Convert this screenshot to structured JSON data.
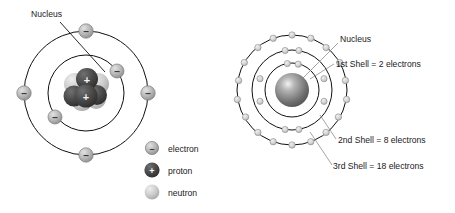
{
  "figure": {
    "background_color": "#ffffff"
  },
  "left_diagram": {
    "name": "bohr-atom-with-nucleus-detail",
    "nucleus_label": "Nucleus",
    "center": {
      "x": 86,
      "y": 93
    },
    "shells": [
      {
        "index": 1,
        "radius": 38,
        "electron_count": 2,
        "electron_angles_deg": [
          -35,
          145
        ]
      },
      {
        "index": 2,
        "radius": 62,
        "electron_count": 4,
        "electron_angles_deg": [
          -90,
          0,
          90,
          180
        ]
      }
    ],
    "nucleus": {
      "protons": 2,
      "neutrons": 4,
      "proton_symbol": "+",
      "proton_color": "#4a4a4a",
      "neutron_color": "#c9c9c9"
    },
    "legend": {
      "items": [
        {
          "icon": "electron-icon",
          "symbol": "–",
          "label": "electron",
          "color": "#b3b3b3"
        },
        {
          "icon": "proton-icon",
          "symbol": "+",
          "label": "proton",
          "color": "#4a4a4a"
        },
        {
          "icon": "neutron-icon",
          "symbol": "",
          "label": "neutron",
          "color": "#c9c9c9"
        }
      ]
    }
  },
  "right_diagram": {
    "name": "bohr-atom-three-shells",
    "center": {
      "x": 64,
      "y": 90
    },
    "nucleus": {
      "label": "Nucleus",
      "radius": 17,
      "color": "#6d6d6d"
    },
    "shells": [
      {
        "index": 1,
        "label": "1st Shell = 2 electrons",
        "radius": 27,
        "electron_count": 2
      },
      {
        "index": 2,
        "label": "2nd Shell = 8 electrons",
        "radius": 40,
        "electron_count": 8
      },
      {
        "index": 3,
        "label": "3rd Shell = 18 electrons",
        "radius": 55,
        "electron_count": 18
      }
    ],
    "electron_color": "#d0d0d0",
    "electron_stroke": "#8a8a8a"
  },
  "colors": {
    "ink": "#1a1a1a",
    "orbit": "#101010",
    "electron_fill": "#b3b3b3",
    "proton_fill": "#4a4a4a",
    "neutron_fill": "#c9c9c9",
    "leader": "#8d8d8d"
  }
}
